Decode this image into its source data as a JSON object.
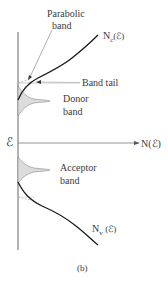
{
  "diagram": {
    "axis": {
      "y_label": "ℰ",
      "x_label": "N(ℰ)"
    },
    "labels": {
      "parabolic_line1": "Parabolic",
      "parabolic_line2": "band",
      "nc": "N",
      "nc_sub": "c",
      "nc_arg": "(ℰ)",
      "band_tail": "Band tail",
      "donor_line1": "Donor",
      "donor_line2": "band",
      "acceptor_line1": "Acceptor",
      "acceptor_line2": "band",
      "nv": "N",
      "nv_sub": "v",
      "nv_arg": "(ℰ)",
      "caption": "(b)"
    },
    "colors": {
      "curve": "#1a1a1a",
      "axis": "#555555",
      "band_fill": "#d9d9d9",
      "guide": "#999999"
    }
  }
}
